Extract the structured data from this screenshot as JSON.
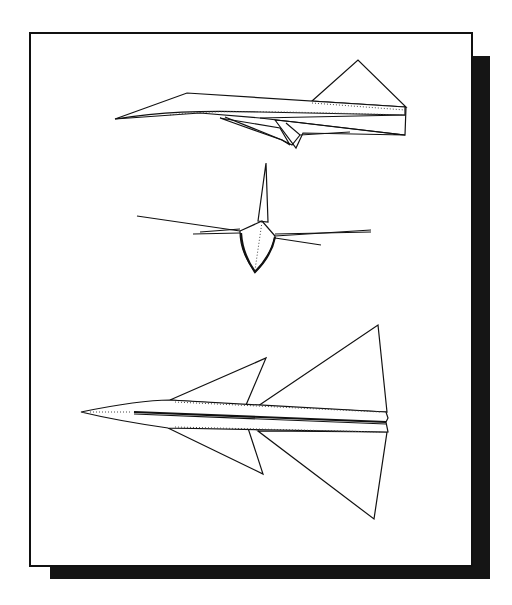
{
  "figure": {
    "views": [
      {
        "id": "side",
        "label": "Side view"
      },
      {
        "id": "front",
        "label": "Front view"
      },
      {
        "id": "top",
        "label": "Top view"
      }
    ],
    "colors": {
      "line": "#111111",
      "background": "#ffffff",
      "shadow": "#151515"
    }
  }
}
